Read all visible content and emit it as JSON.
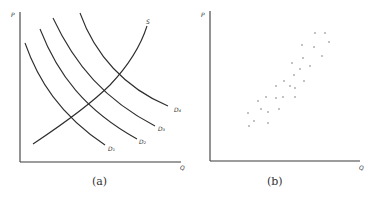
{
  "panels": [
    {
      "id": "a",
      "caption": "(a)",
      "y_axis_label": "P",
      "x_axis_label": "Q",
      "curves": [
        {
          "name": "supply",
          "label": "S"
        },
        {
          "name": "demand-1",
          "label": "D₁"
        },
        {
          "name": "demand-2",
          "label": "D₂"
        },
        {
          "name": "demand-3",
          "label": "D₃"
        },
        {
          "name": "demand-4",
          "label": "D₄"
        }
      ]
    },
    {
      "id": "b",
      "caption": "(b)",
      "y_axis_label": "P",
      "x_axis_label": "Q",
      "points": [
        [
          315,
          33
        ],
        [
          325,
          33
        ],
        [
          329,
          42
        ],
        [
          302,
          45
        ],
        [
          314,
          47
        ],
        [
          303,
          58
        ],
        [
          322,
          56
        ],
        [
          292,
          63
        ],
        [
          310,
          66
        ],
        [
          300,
          69
        ],
        [
          294,
          75
        ],
        [
          304,
          81
        ],
        [
          284,
          81
        ],
        [
          276,
          86
        ],
        [
          290,
          86
        ],
        [
          295,
          88
        ],
        [
          266,
          97
        ],
        [
          276,
          98
        ],
        [
          283,
          97
        ],
        [
          295,
          97
        ],
        [
          258,
          101
        ],
        [
          261,
          109
        ],
        [
          279,
          109
        ],
        [
          248,
          113
        ],
        [
          268,
          112
        ],
        [
          254,
          121
        ],
        [
          249,
          126
        ],
        [
          268,
          123
        ]
      ]
    }
  ],
  "colors": {
    "ink": "#2e2e2e",
    "background": "#ffffff"
  }
}
